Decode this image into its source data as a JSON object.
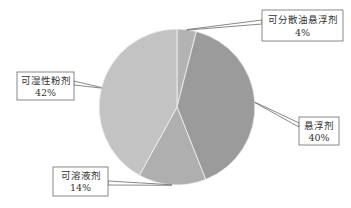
{
  "chart_data": {
    "type": "pie",
    "title": "",
    "start": "top",
    "direction": "clockwise",
    "slices": [
      {
        "label": "可分散油悬浮剂",
        "value": 4,
        "percent_label": "4%",
        "color": "#b3b3b3"
      },
      {
        "label": "悬浮剂",
        "value": 40,
        "percent_label": "40%",
        "color": "#9b9b9b"
      },
      {
        "label": "可溶液剂",
        "value": 14,
        "percent_label": "14%",
        "color": "#afafaf"
      },
      {
        "label": "可湿性粉剂",
        "value": 42,
        "percent_label": "42%",
        "color": "#c3c3c3"
      }
    ],
    "legend": "none",
    "data_labels": "callout"
  }
}
